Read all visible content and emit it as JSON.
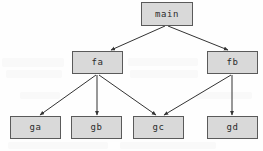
{
  "diagram": {
    "type": "directed-tree",
    "background_color": "#fefefe",
    "node_fill_color": "#d9d9d9",
    "node_border_color": "#5a5a5a",
    "edge_color": "#333333",
    "label_color": "#2b2b2b",
    "nodes": [
      {
        "id": "main",
        "label": "main",
        "level": 0,
        "x": 141,
        "y": 2,
        "w": 52,
        "h": 24
      },
      {
        "id": "fa",
        "label": "fa",
        "level": 1,
        "x": 72,
        "y": 51,
        "w": 51,
        "h": 23
      },
      {
        "id": "fb",
        "label": "fb",
        "level": 1,
        "x": 207,
        "y": 51,
        "w": 51,
        "h": 23
      },
      {
        "id": "ga",
        "label": "ga",
        "level": 2,
        "x": 10,
        "y": 116,
        "w": 51,
        "h": 23
      },
      {
        "id": "gb",
        "label": "gb",
        "level": 2,
        "x": 71,
        "y": 116,
        "w": 51,
        "h": 23
      },
      {
        "id": "gc",
        "label": "gc",
        "level": 2,
        "x": 133,
        "y": 116,
        "w": 51,
        "h": 23
      },
      {
        "id": "gd",
        "label": "gd",
        "level": 2,
        "x": 207,
        "y": 116,
        "w": 51,
        "h": 23
      }
    ],
    "edges": [
      {
        "from": "main",
        "to": "fa",
        "x1": 165,
        "y1": 26,
        "x2": 111,
        "y2": 50
      },
      {
        "from": "main",
        "to": "fb",
        "x1": 168,
        "y1": 26,
        "x2": 228,
        "y2": 50
      },
      {
        "from": "fa",
        "to": "ga",
        "x1": 96,
        "y1": 75,
        "x2": 40,
        "y2": 115
      },
      {
        "from": "fa",
        "to": "gb",
        "x1": 97,
        "y1": 75,
        "x2": 97,
        "y2": 115
      },
      {
        "from": "fa",
        "to": "gc",
        "x1": 99,
        "y1": 75,
        "x2": 156,
        "y2": 115
      },
      {
        "from": "fb",
        "to": "gc",
        "x1": 231,
        "y1": 75,
        "x2": 164,
        "y2": 115
      },
      {
        "from": "fb",
        "to": "gd",
        "x1": 232,
        "y1": 75,
        "x2": 232,
        "y2": 115
      }
    ],
    "noise_marks": [
      {
        "x": 2,
        "y": 58,
        "w": 62,
        "h": 9
      },
      {
        "x": 6,
        "y": 70,
        "w": 56,
        "h": 8
      },
      {
        "x": 128,
        "y": 58,
        "w": 70,
        "h": 8
      },
      {
        "x": 130,
        "y": 70,
        "w": 68,
        "h": 8
      },
      {
        "x": 8,
        "y": 142,
        "w": 100,
        "h": 7
      },
      {
        "x": 120,
        "y": 142,
        "w": 96,
        "h": 7
      },
      {
        "x": 20,
        "y": 92,
        "w": 40,
        "h": 7
      },
      {
        "x": 196,
        "y": 92,
        "w": 56,
        "h": 7
      }
    ]
  }
}
